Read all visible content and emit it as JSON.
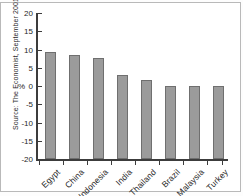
{
  "source_note": "Source: The Economist, September 2001",
  "chart_data": {
    "type": "bar",
    "title": "",
    "xlabel": "",
    "ylabel": "%",
    "ylim": [
      -20,
      20
    ],
    "yticks": [
      20,
      15,
      10,
      5,
      0,
      -5,
      -10,
      -15,
      -20
    ],
    "ytick_labels": [
      "20",
      "15",
      "10",
      "5",
      "0",
      "-5",
      "-10",
      "-15",
      "-20"
    ],
    "grid": false,
    "legend": "none",
    "bar_color": "#9b9b9b",
    "bar_edge_color": "#6f6f6f",
    "axis_color": "#3c3c3c",
    "categories": [
      "Egypt",
      "China",
      "Indonesia",
      "India",
      "Thailand",
      "Brazil",
      "Malaysia",
      "Turkey"
    ],
    "values": [
      9.3,
      8.5,
      7.6,
      3.1,
      1.6,
      -2.5,
      -6.8,
      -10.5
    ]
  }
}
